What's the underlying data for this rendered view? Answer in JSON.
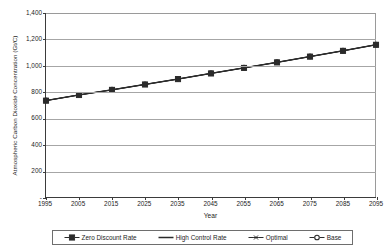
{
  "chart_data": {
    "type": "line",
    "title": "",
    "xlabel": "Year",
    "ylabel": "Atmospheric Carbon Dioxide Concentration (Gt/C)",
    "x": [
      1995,
      2005,
      2015,
      2025,
      2035,
      2045,
      2055,
      2065,
      2075,
      2085,
      2095
    ],
    "xtick_labels": [
      "1995",
      "2005",
      "2015",
      "2025",
      "2035",
      "2045",
      "2055",
      "2065",
      "2075",
      "2085",
      "2095"
    ],
    "ytick_labels": [
      "1,400",
      "1,200",
      "1,000",
      "800",
      "600",
      "400",
      "200",
      "-"
    ],
    "ytick_values": [
      1400,
      1200,
      1000,
      800,
      600,
      400,
      200,
      0
    ],
    "ylim": [
      0,
      1400
    ],
    "xlim": [
      1995,
      2095
    ],
    "grid": "horizontal",
    "legend_position": "bottom",
    "series": [
      {
        "name": "Zero Discount Rate",
        "marker": "square",
        "values": [
          733,
          776,
          815,
          856,
          897,
          940,
          982,
          1024,
          1068,
          1112,
          1158
        ]
      },
      {
        "name": "High Control Rate",
        "marker": "none",
        "values": [
          733,
          775,
          814,
          855,
          896,
          939,
          981,
          1023,
          1067,
          1111,
          1157
        ]
      },
      {
        "name": "Optimal",
        "marker": "asterisk",
        "values": [
          734,
          777,
          816,
          857,
          898,
          941,
          983,
          1025,
          1069,
          1113,
          1159
        ]
      },
      {
        "name": "Base",
        "marker": "circle",
        "values": [
          735,
          778,
          817,
          858,
          899,
          942,
          984,
          1026,
          1070,
          1114,
          1160
        ]
      }
    ]
  },
  "legend": {
    "items": [
      {
        "label": "Zero Discount Rate",
        "key": "square-marker-line-key"
      },
      {
        "label": "High Control Rate",
        "key": "plain-line-key"
      },
      {
        "label": "Optimal",
        "key": "asterisk-marker-line-key"
      },
      {
        "label": "Base",
        "key": "circle-marker-line-key"
      }
    ]
  },
  "colors": {
    "line": "#2b2b2b",
    "grid": "#a6a6a6",
    "axis": "#3b3b3b",
    "text": "#1d1d1d",
    "background": "#ffffff"
  }
}
